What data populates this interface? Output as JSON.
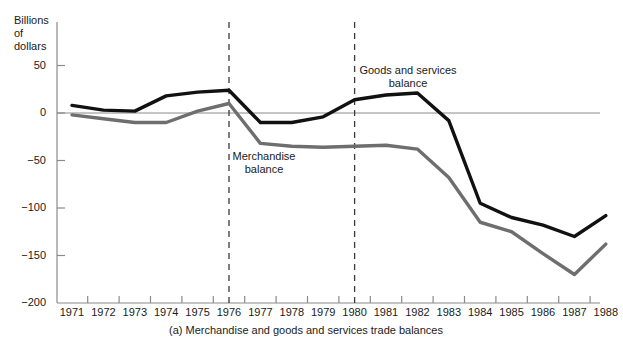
{
  "chart_data": {
    "type": "line",
    "title": "",
    "caption": "(a) Merchandise and goods and services trade balances",
    "ylabel": "Billions\nof\ndollars",
    "xlabel": "",
    "ylim": [
      -200,
      75
    ],
    "xlim": [
      1971,
      1988
    ],
    "yticks": [
      50,
      0,
      -50,
      -100,
      -150,
      -200
    ],
    "ytick_labels": [
      "50",
      "0",
      "−50",
      "−100",
      "−150",
      "−200"
    ],
    "x": [
      1971,
      1972,
      1973,
      1974,
      1975,
      1976,
      1977,
      1978,
      1979,
      1980,
      1981,
      1982,
      1983,
      1984,
      1985,
      1986,
      1987,
      1988
    ],
    "xtick_labels": [
      "1971",
      "1972",
      "1973",
      "1974",
      "1975",
      "1976",
      "1977",
      "1978",
      "1979",
      "1980",
      "1981",
      "1982",
      "1983",
      "1984",
      "1985",
      "1986",
      "1987",
      "1988"
    ],
    "grid": false,
    "zero_line": true,
    "legend_position": "inline-annotations",
    "reference_lines": [
      {
        "type": "vertical",
        "x": 1976,
        "style": "dashed"
      },
      {
        "type": "vertical",
        "x": 1980,
        "style": "dashed"
      }
    ],
    "series": [
      {
        "name": "Goods and services balance",
        "color": "#111111",
        "values": [
          8,
          3,
          2,
          18,
          22,
          24,
          -10,
          -10,
          -4,
          14,
          19,
          21,
          -8,
          -95,
          -110,
          -118,
          -130,
          -108
        ]
      },
      {
        "name": "Merchandise balance",
        "color": "#6e6e6e",
        "values": [
          -2,
          -6,
          -10,
          -10,
          2,
          10,
          -32,
          -35,
          -36,
          -35,
          -34,
          -38,
          -68,
          -115,
          -125,
          -148,
          -170,
          -138
        ]
      }
    ]
  },
  "annotations": {
    "goods_label": "Goods and services\nbalance",
    "merchandise_label": "Merchandise\nbalance"
  }
}
